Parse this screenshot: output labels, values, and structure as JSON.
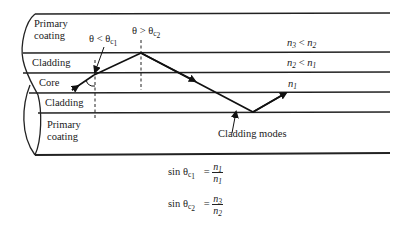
{
  "diagram": {
    "type": "optical-fiber-cross-section",
    "layers": [
      {
        "id": "primary-coating-top",
        "label_line1": "Primary",
        "label_line2": "coating",
        "index_note": "n3 < n2"
      },
      {
        "id": "cladding-top",
        "label": "Cladding",
        "index_note": "n2 < n1"
      },
      {
        "id": "core",
        "label": "Core",
        "index_note": "n1"
      },
      {
        "id": "cladding-bottom",
        "label": "Cladding"
      },
      {
        "id": "primary-coating-bottom",
        "label_line1": "Primary",
        "label_line2": "coating"
      }
    ],
    "angle_labels": {
      "left": {
        "text": "θ < θ",
        "sub1": "c",
        "sub2": "1"
      },
      "right": {
        "text": "θ > θ",
        "sub1": "c",
        "sub2": "2"
      }
    },
    "index_notes": {
      "coating": {
        "n": "n",
        "a": "3",
        "rel": " < ",
        "n2": "n",
        "b": "2"
      },
      "cladding": {
        "n": "n",
        "a": "2",
        "rel": " < ",
        "n2": "n",
        "b": "1"
      },
      "core": {
        "n": "n",
        "a": "1"
      }
    },
    "callout": "Cladding modes",
    "equations": [
      {
        "lhs": "sin θ",
        "sub1": "c",
        "sub2": "1",
        "eq": "=",
        "num": "n",
        "num_sub": "1",
        "den": "n",
        "den_sub": "1"
      },
      {
        "lhs": "sin θ",
        "sub1": "c",
        "sub2": "2",
        "eq": "=",
        "num": "n",
        "num_sub": "3",
        "den": "n",
        "den_sub": "2"
      }
    ]
  }
}
